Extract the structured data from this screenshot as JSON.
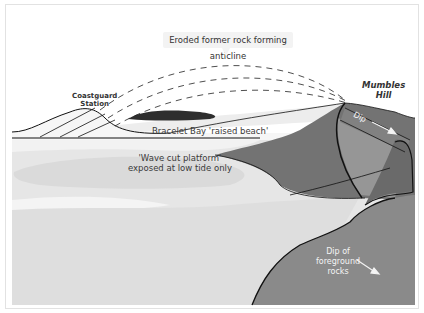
{
  "diagram": {
    "title_callout": "Eroded former rock forming anticline",
    "labels": {
      "coastguard_station_line1": "Coastguard",
      "coastguard_station_line2": "Station",
      "mumbles_hill_line1": "Mumbles",
      "mumbles_hill_line2": "Hill",
      "raised_beach": "Bracelet Bay 'raised beach'",
      "wave_cut_line1": "'Wave cut platform'",
      "wave_cut_line2": "exposed at low tide only",
      "dip": "Dip",
      "foreground_dip_line1": "Dip of",
      "foreground_dip_line2": "foreground",
      "foreground_dip_line3": "rocks"
    },
    "colors": {
      "background": "#ffffff",
      "sky_white": "#ffffff",
      "pale_sand": "#ececec",
      "light_platform": "#dcdcdc",
      "mid_grey_rock": "#8c8c8c",
      "dark_grey_rock": "#6e6e6e",
      "darker_band": "#7a7a7a",
      "black_outcrop": "#2e2e2e",
      "outline": "#111111"
    }
  }
}
